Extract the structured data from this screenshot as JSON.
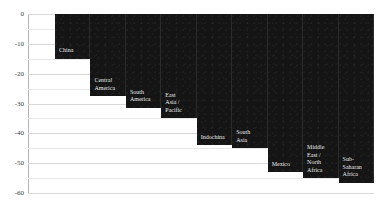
{
  "chart_data": {
    "type": "bar",
    "title": "",
    "subtitle": "",
    "xlabel": "",
    "ylabel": "",
    "ylim": [
      -60,
      0
    ],
    "yticks": [
      0,
      -10,
      -20,
      -30,
      -40,
      -50,
      -60
    ],
    "ytick_labels": [
      "0",
      "-10",
      "-20",
      "-30",
      "-40",
      "-50",
      "-60"
    ],
    "minor_tick_step": 5,
    "grid": true,
    "legend": "none",
    "orientation": "vertical",
    "bar_color": "#151515",
    "label_color": "#f2f2f2",
    "gridline_color": "#d9d9d9",
    "axis_color": "#b6b6b6",
    "categories": [
      "China",
      "Central America",
      "South America",
      "East Asia / Pacific",
      "Indochina",
      "South Asia",
      "Mexico",
      "Middle East / North Africa",
      "Sub-Saharan Africa"
    ],
    "values": [
      -15,
      -27.5,
      -31.5,
      -35,
      -44,
      -45,
      -53,
      -55,
      -56.5
    ],
    "bars": [
      {
        "label": "China",
        "label_lines": "China",
        "value": -15
      },
      {
        "label": "Central America",
        "label_lines": "Central\nAmerica",
        "value": -27.5
      },
      {
        "label": "South America",
        "label_lines": "South\nAmerica",
        "value": -31.5
      },
      {
        "label": "East Asia / Pacific",
        "label_lines": "East\nAsia /\nPacific",
        "value": -35
      },
      {
        "label": "Indochina",
        "label_lines": "Indochina",
        "value": -44
      },
      {
        "label": "South Asia",
        "label_lines": "South\nAsia",
        "value": -45
      },
      {
        "label": "Mexico",
        "label_lines": "Mexico",
        "value": -53
      },
      {
        "label": "Middle East / North Africa",
        "label_lines": "Middle\nEast /\nNorth\nAfrica",
        "value": -55
      },
      {
        "label": "Sub-Saharan Africa",
        "label_lines": "Sub-\nSaharan\nAfrica",
        "value": -56.5
      }
    ]
  }
}
